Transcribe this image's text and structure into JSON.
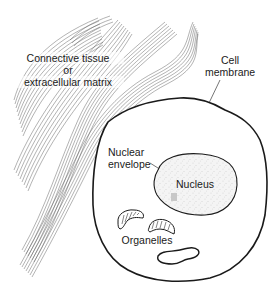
{
  "diagram": {
    "type": "cell-anatomy-illustration",
    "labels": {
      "connective_tissue_line1": "Connective tissue",
      "connective_tissue_line2": "or",
      "connective_tissue_line3": "extracellular matrix",
      "cell_membrane_line1": "Cell",
      "cell_membrane_line2": "membrane",
      "nuclear_envelope_line1": "Nuclear",
      "nuclear_envelope_line2": "envelope",
      "nucleus": "Nucleus",
      "organelles": "Organelles"
    },
    "colors": {
      "line": "#1a1a1a",
      "fiber": "#555555",
      "nucleus_fill": "#f4f4f4",
      "background": "#ffffff"
    },
    "components": [
      {
        "name": "Connective tissue fibers",
        "count_bundles": 4
      },
      {
        "name": "Cell membrane"
      },
      {
        "name": "Nuclear envelope"
      },
      {
        "name": "Nucleus"
      },
      {
        "name": "Mitochondria",
        "count": 2
      },
      {
        "name": "Organelle (vesicle)",
        "count": 1
      }
    ]
  }
}
